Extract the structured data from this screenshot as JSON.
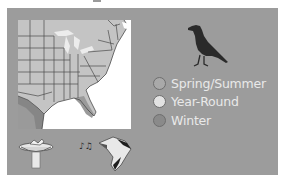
{
  "panel": {
    "background": "#9c9c9c"
  },
  "map": {
    "region": "Eastern United States",
    "colors": {
      "spring_summer": "#c4c4c4",
      "year_round": "#e4e4e4",
      "winter": "#868686",
      "ocean": "#ffffff",
      "border": "#4a4a4a"
    }
  },
  "legend": {
    "items": [
      {
        "label": "Spring/Summer",
        "color": "#a9a9a9"
      },
      {
        "label": "Year-Round",
        "color": "#e2e2e2"
      },
      {
        "label": "Winter",
        "color": "#8a8a8a"
      }
    ]
  },
  "icons": {
    "species": "bird-silhouette-icon",
    "feeder": "bird-bath-icon",
    "song": "singing-bird-icon"
  }
}
